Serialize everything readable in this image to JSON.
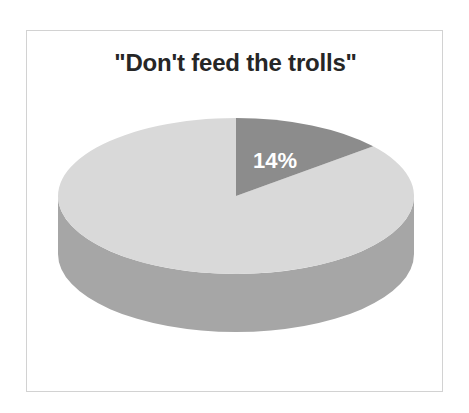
{
  "chart_data": {
    "type": "pie",
    "title": "\"Don't feed the trolls\"",
    "xlabel": "",
    "ylabel": "",
    "three_d": true,
    "legend": "none",
    "grid": false,
    "start_angle_deg": 0,
    "direction": "clockwise",
    "categories": [
      "Feed the trolls",
      "Don't feed the trolls"
    ],
    "values": [
      14,
      86
    ],
    "labels_shown": [
      "14%",
      ""
    ],
    "slices": [
      {
        "name": "Feed the trolls",
        "value": 14,
        "label": "14%",
        "top_color": "#8c8c8c",
        "side_color": "#767676",
        "label_color": "#ffffff"
      },
      {
        "name": "Don't feed the trolls",
        "value": 86,
        "label": "",
        "top_color": "#d9d9d9",
        "side_color": "#a6a6a6",
        "label_color": "#ffffff"
      }
    ]
  },
  "frame": {
    "border_color": "#d2d2d2",
    "background": "#ffffff"
  },
  "title": {
    "text": "\"Don't feed the trolls\"",
    "color": "#262626"
  },
  "label_14": {
    "text": "14%"
  }
}
